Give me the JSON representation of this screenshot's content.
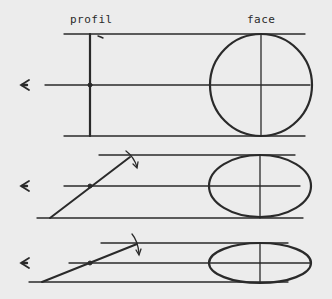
{
  "labels": {
    "profile": "profil",
    "face": "face"
  },
  "colors": {
    "background": "#ececec",
    "ink": "#2a2a2a"
  },
  "panels": [
    {
      "name": "upright",
      "description": "Disk seen edge-on in profile, full circle in face view",
      "tilt_deg": 90,
      "face_shape": "circle",
      "face_rx": 51,
      "face_ry": 51
    },
    {
      "name": "tilted",
      "description": "Disk tilted back, ellipse in face view",
      "tilt_deg": 38,
      "face_shape": "ellipse",
      "face_rx": 51,
      "face_ry": 32
    },
    {
      "name": "more-tilted",
      "description": "Disk tilted further, flatter ellipse in face view",
      "tilt_deg": 22,
      "face_shape": "ellipse",
      "face_rx": 51,
      "face_ry": 20
    }
  ],
  "icons": {
    "eye": "eye-viewpoint-icon",
    "rotation_arrow": "rotation-arrow-icon"
  }
}
